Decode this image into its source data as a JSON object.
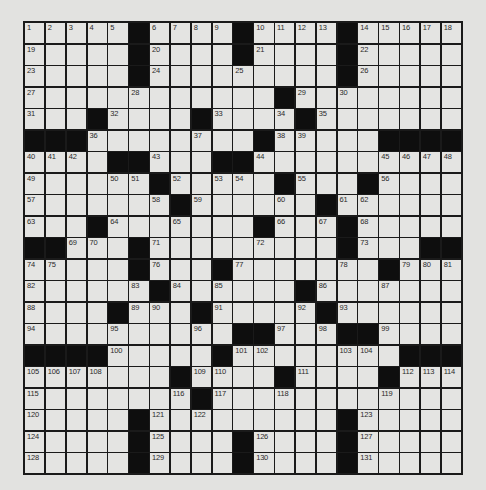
{
  "puzzle": {
    "rows": 21,
    "cols": 21,
    "colors": {
      "background": "#e2e2e0",
      "cell": "#e4e4e2",
      "block": "#0e0e0e",
      "gridline": "#1a1a1a",
      "number": "#2a2a2a"
    },
    "layout": [
      ".....#....#....#.....",
      ".....#....#....#.....",
      ".....#.........#.....",
      "............#........",
      "...#....#....#.......",
      "###........#.....####",
      "....##...##..........",
      "......#.....#...#....",
      ".......#......#......",
      "...#.......#...#.....",
      "##...#.........#...##",
      ".....#...#.......#...",
      "......#......#.......",
      "....#...#.....#......",
      "..........##...##....",
      "####.....#........###",
      ".......#....#....#...",
      "........#............",
      ".....#.........#.....",
      ".....#....#....#.....",
      ".....#....#....#....."
    ],
    "numbers": [
      {
        "r": 0,
        "c": 0,
        "n": 1
      },
      {
        "r": 0,
        "c": 1,
        "n": 2
      },
      {
        "r": 0,
        "c": 2,
        "n": 3
      },
      {
        "r": 0,
        "c": 3,
        "n": 4
      },
      {
        "r": 0,
        "c": 4,
        "n": 5
      },
      {
        "r": 0,
        "c": 6,
        "n": 6
      },
      {
        "r": 0,
        "c": 7,
        "n": 7
      },
      {
        "r": 0,
        "c": 8,
        "n": 8
      },
      {
        "r": 0,
        "c": 9,
        "n": 9
      },
      {
        "r": 0,
        "c": 11,
        "n": 10
      },
      {
        "r": 0,
        "c": 12,
        "n": 11
      },
      {
        "r": 0,
        "c": 13,
        "n": 12
      },
      {
        "r": 0,
        "c": 14,
        "n": 13
      },
      {
        "r": 0,
        "c": 16,
        "n": 14
      },
      {
        "r": 0,
        "c": 17,
        "n": 15
      },
      {
        "r": 0,
        "c": 18,
        "n": 16
      },
      {
        "r": 0,
        "c": 19,
        "n": 17
      },
      {
        "r": 0,
        "c": 20,
        "n": 18
      },
      {
        "r": 1,
        "c": 0,
        "n": 19
      },
      {
        "r": 1,
        "c": 6,
        "n": 20
      },
      {
        "r": 1,
        "c": 11,
        "n": 21
      },
      {
        "r": 1,
        "c": 16,
        "n": 22
      },
      {
        "r": 2,
        "c": 0,
        "n": 23
      },
      {
        "r": 2,
        "c": 6,
        "n": 24
      },
      {
        "r": 2,
        "c": 10,
        "n": 25
      },
      {
        "r": 2,
        "c": 16,
        "n": 26
      },
      {
        "r": 3,
        "c": 0,
        "n": 27
      },
      {
        "r": 3,
        "c": 5,
        "n": 28
      },
      {
        "r": 3,
        "c": 13,
        "n": 29
      },
      {
        "r": 3,
        "c": 15,
        "n": 30
      },
      {
        "r": 4,
        "c": 0,
        "n": 31
      },
      {
        "r": 4,
        "c": 4,
        "n": 32
      },
      {
        "r": 4,
        "c": 9,
        "n": 33
      },
      {
        "r": 4,
        "c": 12,
        "n": 34
      },
      {
        "r": 4,
        "c": 14,
        "n": 35
      },
      {
        "r": 5,
        "c": 3,
        "n": 36
      },
      {
        "r": 5,
        "c": 8,
        "n": 37
      },
      {
        "r": 5,
        "c": 12,
        "n": 38
      },
      {
        "r": 5,
        "c": 13,
        "n": 39
      },
      {
        "r": 6,
        "c": 0,
        "n": 40
      },
      {
        "r": 6,
        "c": 1,
        "n": 41
      },
      {
        "r": 6,
        "c": 2,
        "n": 42
      },
      {
        "r": 6,
        "c": 6,
        "n": 43
      },
      {
        "r": 6,
        "c": 11,
        "n": 44
      },
      {
        "r": 6,
        "c": 17,
        "n": 45
      },
      {
        "r": 6,
        "c": 18,
        "n": 46
      },
      {
        "r": 6,
        "c": 19,
        "n": 47
      },
      {
        "r": 6,
        "c": 20,
        "n": 48
      },
      {
        "r": 7,
        "c": 0,
        "n": 49
      },
      {
        "r": 7,
        "c": 4,
        "n": 50
      },
      {
        "r": 7,
        "c": 5,
        "n": 51
      },
      {
        "r": 7,
        "c": 7,
        "n": 52
      },
      {
        "r": 7,
        "c": 9,
        "n": 53
      },
      {
        "r": 7,
        "c": 10,
        "n": 54
      },
      {
        "r": 7,
        "c": 13,
        "n": 55
      },
      {
        "r": 7,
        "c": 17,
        "n": 56
      },
      {
        "r": 8,
        "c": 0,
        "n": 57
      },
      {
        "r": 8,
        "c": 6,
        "n": 58
      },
      {
        "r": 8,
        "c": 8,
        "n": 59
      },
      {
        "r": 8,
        "c": 12,
        "n": 60
      },
      {
        "r": 8,
        "c": 15,
        "n": 61
      },
      {
        "r": 8,
        "c": 16,
        "n": 62
      },
      {
        "r": 9,
        "c": 0,
        "n": 63
      },
      {
        "r": 9,
        "c": 4,
        "n": 64
      },
      {
        "r": 9,
        "c": 7,
        "n": 65
      },
      {
        "r": 9,
        "c": 12,
        "n": 66
      },
      {
        "r": 9,
        "c": 14,
        "n": 67
      },
      {
        "r": 9,
        "c": 16,
        "n": 68
      },
      {
        "r": 10,
        "c": 2,
        "n": 69
      },
      {
        "r": 10,
        "c": 3,
        "n": 70
      },
      {
        "r": 10,
        "c": 6,
        "n": 71
      },
      {
        "r": 10,
        "c": 11,
        "n": 72
      },
      {
        "r": 10,
        "c": 16,
        "n": 73
      },
      {
        "r": 11,
        "c": 0,
        "n": 74
      },
      {
        "r": 11,
        "c": 1,
        "n": 75
      },
      {
        "r": 11,
        "c": 6,
        "n": 76
      },
      {
        "r": 11,
        "c": 10,
        "n": 77
      },
      {
        "r": 11,
        "c": 15,
        "n": 78
      },
      {
        "r": 11,
        "c": 18,
        "n": 79
      },
      {
        "r": 11,
        "c": 19,
        "n": 80
      },
      {
        "r": 11,
        "c": 20,
        "n": 81
      },
      {
        "r": 12,
        "c": 0,
        "n": 82
      },
      {
        "r": 12,
        "c": 5,
        "n": 83
      },
      {
        "r": 12,
        "c": 7,
        "n": 84
      },
      {
        "r": 12,
        "c": 9,
        "n": 85
      },
      {
        "r": 12,
        "c": 14,
        "n": 86
      },
      {
        "r": 12,
        "c": 17,
        "n": 87
      },
      {
        "r": 13,
        "c": 0,
        "n": 88
      },
      {
        "r": 13,
        "c": 5,
        "n": 89
      },
      {
        "r": 13,
        "c": 6,
        "n": 90
      },
      {
        "r": 13,
        "c": 9,
        "n": 91
      },
      {
        "r": 13,
        "c": 13,
        "n": 92
      },
      {
        "r": 13,
        "c": 15,
        "n": 93
      },
      {
        "r": 14,
        "c": 0,
        "n": 94
      },
      {
        "r": 14,
        "c": 4,
        "n": 95
      },
      {
        "r": 14,
        "c": 8,
        "n": 96
      },
      {
        "r": 14,
        "c": 12,
        "n": 97
      },
      {
        "r": 14,
        "c": 14,
        "n": 98
      },
      {
        "r": 14,
        "c": 17,
        "n": 99
      },
      {
        "r": 15,
        "c": 4,
        "n": 100
      },
      {
        "r": 15,
        "c": 10,
        "n": 101
      },
      {
        "r": 15,
        "c": 11,
        "n": 102
      },
      {
        "r": 15,
        "c": 15,
        "n": 103
      },
      {
        "r": 15,
        "c": 16,
        "n": 104
      },
      {
        "r": 16,
        "c": 0,
        "n": 105
      },
      {
        "r": 16,
        "c": 1,
        "n": 106
      },
      {
        "r": 16,
        "c": 2,
        "n": 107
      },
      {
        "r": 16,
        "c": 3,
        "n": 108
      },
      {
        "r": 16,
        "c": 8,
        "n": 109
      },
      {
        "r": 16,
        "c": 9,
        "n": 110
      },
      {
        "r": 16,
        "c": 13,
        "n": 111
      },
      {
        "r": 16,
        "c": 18,
        "n": 112
      },
      {
        "r": 16,
        "c": 19,
        "n": 113
      },
      {
        "r": 16,
        "c": 20,
        "n": 114
      },
      {
        "r": 17,
        "c": 0,
        "n": 115
      },
      {
        "r": 17,
        "c": 7,
        "n": 116
      },
      {
        "r": 17,
        "c": 9,
        "n": 117
      },
      {
        "r": 17,
        "c": 12,
        "n": 118
      },
      {
        "r": 17,
        "c": 17,
        "n": 119
      },
      {
        "r": 18,
        "c": 0,
        "n": 120
      },
      {
        "r": 18,
        "c": 6,
        "n": 121
      },
      {
        "r": 18,
        "c": 8,
        "n": 122
      },
      {
        "r": 18,
        "c": 16,
        "n": 123
      },
      {
        "r": 19,
        "c": 0,
        "n": 124
      },
      {
        "r": 19,
        "c": 6,
        "n": 125
      },
      {
        "r": 19,
        "c": 11,
        "n": 126
      },
      {
        "r": 19,
        "c": 16,
        "n": 127
      },
      {
        "r": 20,
        "c": 0,
        "n": 128
      },
      {
        "r": 20,
        "c": 6,
        "n": 129
      },
      {
        "r": 20,
        "c": 11,
        "n": 130
      },
      {
        "r": 20,
        "c": 16,
        "n": 131
      }
    ],
    "entries": []
  }
}
